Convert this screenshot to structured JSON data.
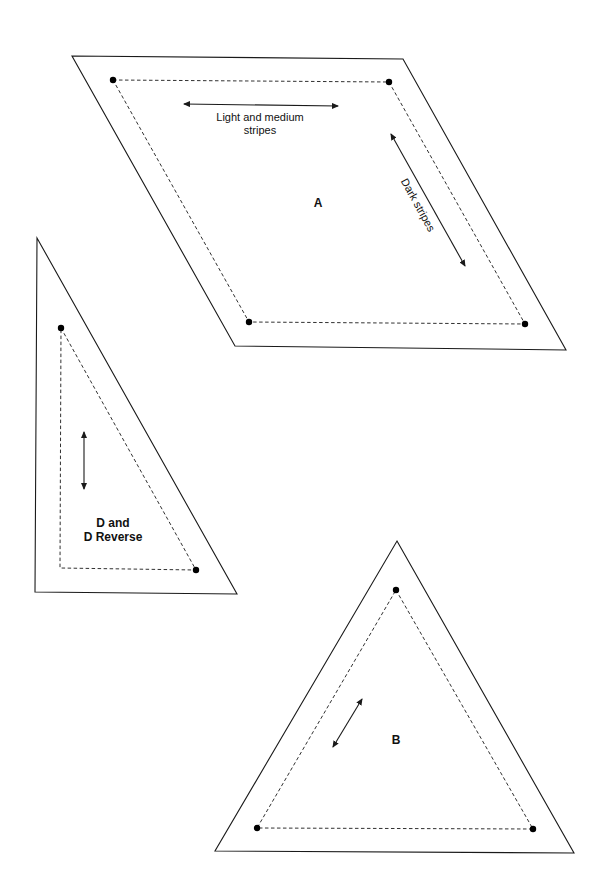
{
  "diagram": {
    "type": "quilt-template-pieces",
    "colors": {
      "ink": "#1a1a1a",
      "background": "#ffffff"
    },
    "pieces": [
      {
        "id": "A",
        "label": "A",
        "shape": "parallelogram",
        "grain_notes": [
          {
            "line1": "Light and medium",
            "line2": "stripes"
          },
          {
            "text": "Dark stripes"
          }
        ]
      },
      {
        "id": "D",
        "label_line1": "D and",
        "label_line2": "D Reverse",
        "shape": "right-triangle"
      },
      {
        "id": "B",
        "label": "B",
        "shape": "equilateral-triangle"
      }
    ]
  }
}
